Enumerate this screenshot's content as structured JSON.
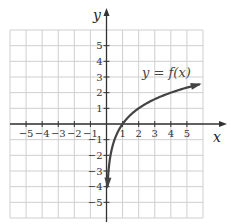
{
  "chart_data": {
    "type": "line",
    "title": "",
    "xlabel": "x",
    "ylabel": "y",
    "xlim": [
      -6,
      6
    ],
    "ylim": [
      -6,
      6
    ],
    "grid": true,
    "x_ticks": [
      -5,
      -4,
      -3,
      -2,
      -1,
      1,
      2,
      3,
      4,
      5
    ],
    "y_ticks": [
      -5,
      -4,
      -3,
      -2,
      -1,
      1,
      2,
      3,
      4,
      5
    ],
    "x_tick_labels": [
      "−5",
      "−4",
      "−3",
      "−2",
      "−1",
      "1",
      "2",
      "3",
      "4",
      "5"
    ],
    "y_tick_labels": [
      "5",
      "4",
      "3",
      "2",
      "1",
      "−1",
      "−2",
      "−3",
      "−4",
      "−5"
    ],
    "series": [
      {
        "name": "y = f(x)",
        "points": [
          [
            0.0625,
            -4
          ],
          [
            0.125,
            -3
          ],
          [
            0.25,
            -2
          ],
          [
            0.5,
            -1
          ],
          [
            1,
            0
          ],
          [
            2,
            1
          ],
          [
            3,
            1.58
          ],
          [
            4,
            2
          ],
          [
            5,
            2.32
          ],
          [
            5.8,
            2.54
          ]
        ],
        "arrow_ends": true
      }
    ],
    "annotations": [
      {
        "text": "y = f(x)",
        "x": 4.3,
        "y": 3.4
      }
    ]
  },
  "labels": {
    "x_axis": "x",
    "y_axis": "y",
    "function": "y = f(x)"
  },
  "colors": {
    "grid": "#cfcfcf",
    "axis": "#333333",
    "curve": "#444444"
  }
}
